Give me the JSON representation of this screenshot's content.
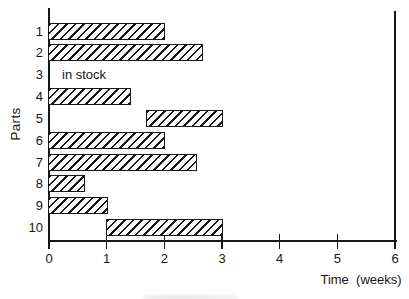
{
  "chart_data": {
    "type": "bar",
    "subtype": "horizontal-gantt-leadtime",
    "title": "",
    "ylabel": "Parts",
    "xlabel": "Time  (weeks)",
    "xlim": [
      0,
      6
    ],
    "x_ticks": [
      0,
      1,
      2,
      3,
      4,
      5,
      6
    ],
    "grid": "off",
    "bar_style": "diagonal-hatch-forward-slash",
    "ink_color": "#161616",
    "background_color": "#ffffff",
    "rows": [
      {
        "part": "1",
        "start": 0,
        "end": 2.0
      },
      {
        "part": "2",
        "start": 0,
        "end": 2.65
      },
      {
        "part": "3",
        "note": "in stock"
      },
      {
        "part": "4",
        "start": 0,
        "end": 1.4
      },
      {
        "part": "5",
        "start": 1.7,
        "end": 3.0
      },
      {
        "part": "6",
        "start": 0,
        "end": 2.0
      },
      {
        "part": "7",
        "start": 0,
        "end": 2.55
      },
      {
        "part": "8",
        "start": 0,
        "end": 0.6
      },
      {
        "part": "9",
        "start": 0,
        "end": 1.0
      },
      {
        "part": "10",
        "start": 1.0,
        "end": 3.0
      }
    ]
  }
}
